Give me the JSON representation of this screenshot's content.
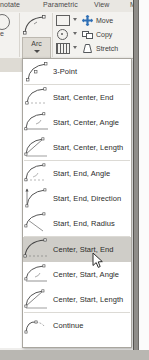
{
  "app": {
    "context": "autocad-arc-dropdown"
  },
  "ribbon": {
    "tabs": [
      {
        "label": "nnotate",
        "name": "tab-annotate"
      },
      {
        "label": "Parametric",
        "name": "tab-parametric"
      },
      {
        "label": "View",
        "name": "tab-view"
      },
      {
        "label": "M",
        "name": "tab-manage"
      }
    ],
    "arc_button": {
      "label": "Arc",
      "icon": "arc-icon",
      "dropdown_icon": "caret-down-icon"
    },
    "draw_minis": [
      {
        "icon": "rectangle-icon",
        "name": "rectangle-tool"
      },
      {
        "icon": "ellipse-icon",
        "name": "ellipse-tool"
      },
      {
        "icon": "table-icon",
        "name": "table-tool"
      }
    ],
    "modify_commands": [
      {
        "label": "Move",
        "icon": "move-icon"
      },
      {
        "label": "Copy",
        "icon": "copy-icon"
      },
      {
        "label": "Stretch",
        "icon": "stretch-icon"
      }
    ],
    "left_partial_label": "e"
  },
  "menu": {
    "name": "arc-dropdown-menu",
    "selected": "Center, Start, End",
    "groups": [
      {
        "items": [
          {
            "label": "3-Point",
            "icon": "arc-3point-icon"
          }
        ]
      },
      {
        "items": [
          {
            "label": "Start, Center, End",
            "icon": "arc-start-center-end-icon"
          },
          {
            "label": "Start, Center, Angle",
            "icon": "arc-start-center-angle-icon"
          },
          {
            "label": "Start, Center, Length",
            "icon": "arc-start-center-length-icon"
          }
        ]
      },
      {
        "items": [
          {
            "label": "Start, End, Angle",
            "icon": "arc-start-end-angle-icon"
          },
          {
            "label": "Start, End, Direction",
            "icon": "arc-start-end-direction-icon"
          },
          {
            "label": "Start, End, Radius",
            "icon": "arc-start-end-radius-icon"
          }
        ]
      },
      {
        "items": [
          {
            "label": "Center, Start, End",
            "icon": "arc-center-start-end-icon"
          },
          {
            "label": "Center, Start, Angle",
            "icon": "arc-center-start-angle-icon"
          },
          {
            "label": "Center, Start, Length",
            "icon": "arc-center-start-length-icon"
          }
        ]
      },
      {
        "items": [
          {
            "label": "Continue",
            "icon": "arc-continue-icon"
          }
        ]
      }
    ]
  },
  "colors": {
    "menu_bg": "#ffffff",
    "menu_border": "#a9a69f",
    "highlight": "#cfcdc8",
    "ribbon_panel": "#f3f2ef",
    "ribbon_tabs": "#e9e7e2",
    "text": "#2b2b2b"
  }
}
